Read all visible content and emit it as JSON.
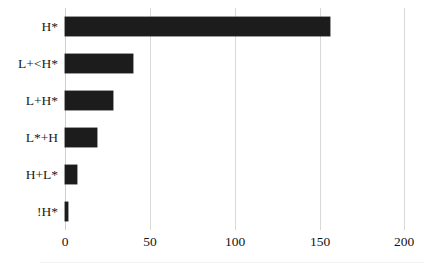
{
  "chart_data": {
    "type": "bar",
    "orientation": "horizontal",
    "title": "",
    "subtitle": "",
    "xlabel": "",
    "ylabel": "",
    "categories": [
      "H*",
      "L+<H*",
      "L+H*",
      "L*+H",
      "H+L*",
      "!H*"
    ],
    "values": [
      156,
      40,
      28,
      19,
      7,
      2
    ],
    "series": [
      {
        "name": "count",
        "values": [
          156,
          40,
          28,
          19,
          7,
          2
        ]
      }
    ],
    "xlim": [
      0,
      200
    ],
    "xticks": [
      0,
      50,
      100,
      150,
      200
    ],
    "xtick_labels": [
      "0",
      "50",
      "100",
      "150",
      "200"
    ],
    "grid": "vertical",
    "legend": "none",
    "annotations": [],
    "colors": {
      "bar": "#1c1c1c",
      "gridline": "#d8d8d8",
      "background": "#ffffff",
      "text": "#141414"
    }
  }
}
